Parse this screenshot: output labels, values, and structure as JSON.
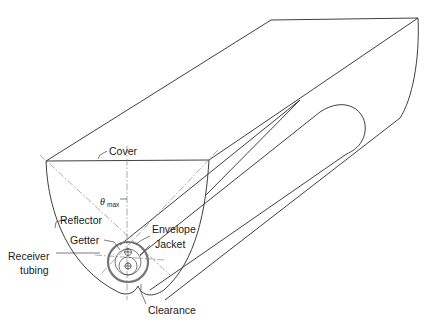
{
  "diagram": {
    "labels": {
      "cover": "Cover",
      "theta_max_symbol": "θ",
      "theta_max_subscript": "max",
      "reflector": "Reflector",
      "getter": "Getter",
      "envelope": "Envelope",
      "jacket": "Jacket",
      "receiver_line1": "Receiver",
      "receiver_line2": "tubing",
      "clearance": "Clearance"
    },
    "colors": {
      "line": "#2a2a2a",
      "construction_line": "#888888",
      "envelope_ring": "#777777",
      "background": "#ffffff"
    }
  }
}
